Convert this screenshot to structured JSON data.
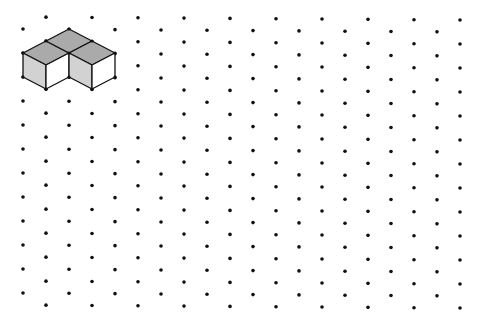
{
  "diagram": {
    "type": "isometric-dot-grid",
    "background": "#ffffff",
    "dot_color": "#111111",
    "dot_radius": 1.8,
    "grid": {
      "x_start": 23,
      "x_step": 23,
      "columns": 20,
      "y_step": 24,
      "odd_column_y_start": 29,
      "odd_column_count": 12,
      "even_column_y_start": 17,
      "even_column_count": 13,
      "right_drift_px": 3
    },
    "shape": {
      "name": "two-cube-L-block",
      "stroke": "#111111",
      "stroke_width": 1.3,
      "colors": {
        "top": "#aaaaaa",
        "left": "#d2d2d2",
        "right": "#ffffff"
      },
      "faces": [
        {
          "name": "top-left-face",
          "shade": "top",
          "points": [
            [
              23,
              53
            ],
            [
              46,
              41
            ],
            [
              69,
              53
            ],
            [
              46,
              65
            ]
          ]
        },
        {
          "name": "top-middle-face",
          "shade": "top",
          "points": [
            [
              46,
              41
            ],
            [
              69,
              29
            ],
            [
              92,
              41
            ],
            [
              69,
              53
            ]
          ]
        },
        {
          "name": "top-right-face",
          "shade": "top",
          "points": [
            [
              69,
              53
            ],
            [
              92,
              41
            ],
            [
              115,
              53
            ],
            [
              92,
              65
            ]
          ]
        },
        {
          "name": "left-cube-left-face",
          "shade": "left",
          "points": [
            [
              23,
              53
            ],
            [
              46,
              65
            ],
            [
              46,
              89
            ],
            [
              23,
              77
            ]
          ]
        },
        {
          "name": "left-cube-right-face",
          "shade": "right",
          "points": [
            [
              46,
              65
            ],
            [
              69,
              53
            ],
            [
              69,
              77
            ],
            [
              46,
              89
            ]
          ]
        },
        {
          "name": "right-cube-left-face",
          "shade": "left",
          "points": [
            [
              69,
              53
            ],
            [
              92,
              65
            ],
            [
              92,
              89
            ],
            [
              69,
              77
            ]
          ]
        },
        {
          "name": "right-cube-right-face",
          "shade": "right",
          "points": [
            [
              92,
              65
            ],
            [
              115,
              53
            ],
            [
              115,
              77
            ],
            [
              92,
              89
            ]
          ]
        }
      ],
      "vertex_dots": [
        [
          69,
          29
        ],
        [
          46,
          41
        ],
        [
          92,
          41
        ],
        [
          23,
          53
        ],
        [
          69,
          53
        ],
        [
          115,
          53
        ],
        [
          23,
          77
        ],
        [
          69,
          77
        ],
        [
          115,
          77
        ],
        [
          46,
          89
        ],
        [
          92,
          89
        ]
      ]
    }
  }
}
